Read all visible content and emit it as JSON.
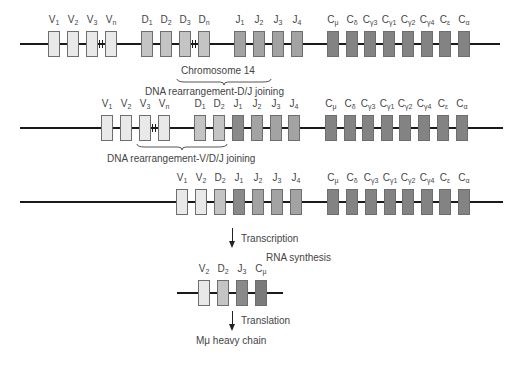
{
  "colors": {
    "V": "#e9e9e9",
    "D": "#c4c4c4",
    "J": "#a3a3a3",
    "J_dark": "#8a8a8a",
    "C": "#838383",
    "C_mu_rna": "#7a7a7a",
    "line": "#1a1a1a"
  },
  "rows": [
    {
      "name": "germline",
      "line": {
        "x1": 20,
        "x2": 500,
        "y": 44
      },
      "segments": [
        {
          "id": "V1",
          "base": "V",
          "sub": "1",
          "x": 48,
          "type": "V"
        },
        {
          "id": "V2",
          "base": "V",
          "sub": "2",
          "x": 67,
          "type": "V"
        },
        {
          "id": "V3",
          "base": "V",
          "sub": "3",
          "x": 86,
          "type": "V"
        },
        {
          "id": "Vn",
          "base": "V",
          "sub": "n",
          "x": 105,
          "type": "V"
        },
        {
          "id": "D1",
          "base": "D",
          "sub": "1",
          "x": 141,
          "type": "D"
        },
        {
          "id": "D2",
          "base": "D",
          "sub": "2",
          "x": 160,
          "type": "D"
        },
        {
          "id": "D3",
          "base": "D",
          "sub": "3",
          "x": 179,
          "type": "D"
        },
        {
          "id": "Dn",
          "base": "D",
          "sub": "n",
          "x": 198,
          "type": "D"
        },
        {
          "id": "J1",
          "base": "J",
          "sub": "1",
          "x": 234,
          "type": "J"
        },
        {
          "id": "J2",
          "base": "J",
          "sub": "2",
          "x": 253,
          "type": "J"
        },
        {
          "id": "J3",
          "base": "J",
          "sub": "3",
          "x": 272,
          "type": "J"
        },
        {
          "id": "J4",
          "base": "J",
          "sub": "4",
          "x": 291,
          "type": "J"
        },
        {
          "id": "Cmu",
          "base": "C",
          "sub": "μ",
          "x": 327,
          "type": "C"
        },
        {
          "id": "Cdelta",
          "base": "C",
          "sub": "δ",
          "x": 346,
          "type": "C"
        },
        {
          "id": "Cgamma3",
          "base": "C",
          "sub": "γ3",
          "x": 364,
          "type": "C"
        },
        {
          "id": "Cgamma1",
          "base": "C",
          "sub": "γ1",
          "x": 383,
          "type": "C"
        },
        {
          "id": "Cgamma2",
          "base": "C",
          "sub": "γ2",
          "x": 402,
          "type": "C"
        },
        {
          "id": "Cgamma4",
          "base": "C",
          "sub": "γ4",
          "x": 421,
          "type": "C"
        },
        {
          "id": "Cepsilon",
          "base": "C",
          "sub": "ε",
          "x": 439,
          "type": "C"
        },
        {
          "id": "Calpha",
          "base": "C",
          "sub": "α",
          "x": 458,
          "type": "C"
        }
      ],
      "breaks": [
        {
          "x": 99
        },
        {
          "x": 192
        }
      ]
    },
    {
      "name": "dj-joined",
      "line": {
        "x1": 20,
        "x2": 503,
        "y": 128
      },
      "segments": [
        {
          "id": "V1",
          "base": "V",
          "sub": "1",
          "x": 101,
          "type": "V"
        },
        {
          "id": "V2",
          "base": "V",
          "sub": "2",
          "x": 120,
          "type": "V"
        },
        {
          "id": "V3",
          "base": "V",
          "sub": "3",
          "x": 139,
          "type": "V"
        },
        {
          "id": "Vn",
          "base": "V",
          "sub": "n",
          "x": 158,
          "type": "V"
        },
        {
          "id": "D1",
          "base": "D",
          "sub": "1",
          "x": 194,
          "type": "D"
        },
        {
          "id": "D2",
          "base": "D",
          "sub": "2",
          "x": 213,
          "type": "D"
        },
        {
          "id": "J1",
          "base": "J",
          "sub": "1",
          "x": 232,
          "type": "J_dark"
        },
        {
          "id": "J2",
          "base": "J",
          "sub": "2",
          "x": 251,
          "type": "J"
        },
        {
          "id": "J3",
          "base": "J",
          "sub": "3",
          "x": 270,
          "type": "J"
        },
        {
          "id": "J4",
          "base": "J",
          "sub": "4",
          "x": 288,
          "type": "J"
        },
        {
          "id": "Cmu",
          "base": "C",
          "sub": "μ",
          "x": 325,
          "type": "C"
        },
        {
          "id": "Cdelta",
          "base": "C",
          "sub": "δ",
          "x": 344,
          "type": "C"
        },
        {
          "id": "Cgamma3",
          "base": "C",
          "sub": "γ3",
          "x": 362,
          "type": "C"
        },
        {
          "id": "Cgamma1",
          "base": "C",
          "sub": "γ1",
          "x": 381,
          "type": "C"
        },
        {
          "id": "Cgamma2",
          "base": "C",
          "sub": "γ2",
          "x": 399,
          "type": "C"
        },
        {
          "id": "Cgamma4",
          "base": "C",
          "sub": "γ4",
          "x": 418,
          "type": "C"
        },
        {
          "id": "Cepsilon",
          "base": "C",
          "sub": "ε",
          "x": 437,
          "type": "C"
        },
        {
          "id": "Calpha",
          "base": "C",
          "sub": "α",
          "x": 456,
          "type": "C"
        }
      ],
      "breaks": [
        {
          "x": 152
        }
      ]
    },
    {
      "name": "vdj-joined",
      "line": {
        "x1": 20,
        "x2": 503,
        "y": 202
      },
      "segments": [
        {
          "id": "V1",
          "base": "V",
          "sub": "1",
          "x": 176,
          "type": "V"
        },
        {
          "id": "V2",
          "base": "V",
          "sub": "2",
          "x": 195,
          "type": "V"
        },
        {
          "id": "D2",
          "base": "D",
          "sub": "2",
          "x": 214,
          "type": "D"
        },
        {
          "id": "J1",
          "base": "J",
          "sub": "1",
          "x": 233,
          "type": "J_dark"
        },
        {
          "id": "J2",
          "base": "J",
          "sub": "2",
          "x": 252,
          "type": "J"
        },
        {
          "id": "J3",
          "base": "J",
          "sub": "3",
          "x": 271,
          "type": "J"
        },
        {
          "id": "J4",
          "base": "J",
          "sub": "4",
          "x": 290,
          "type": "J"
        },
        {
          "id": "Cmu",
          "base": "C",
          "sub": "μ",
          "x": 327,
          "type": "C"
        },
        {
          "id": "Cdelta",
          "base": "C",
          "sub": "δ",
          "x": 346,
          "type": "C"
        },
        {
          "id": "Cgamma3",
          "base": "C",
          "sub": "γ3",
          "x": 365,
          "type": "C"
        },
        {
          "id": "Cgamma1",
          "base": "C",
          "sub": "γ1",
          "x": 384,
          "type": "C"
        },
        {
          "id": "Cgamma2",
          "base": "C",
          "sub": "γ2",
          "x": 402,
          "type": "C"
        },
        {
          "id": "Cgamma4",
          "base": "C",
          "sub": "γ4",
          "x": 421,
          "type": "C"
        },
        {
          "id": "Cepsilon",
          "base": "C",
          "sub": "ε",
          "x": 439,
          "type": "C"
        },
        {
          "id": "Calpha",
          "base": "C",
          "sub": "α",
          "x": 458,
          "type": "C"
        }
      ],
      "breaks": []
    },
    {
      "name": "rna",
      "line": {
        "x1": 177,
        "x2": 283,
        "y": 293
      },
      "segments": [
        {
          "id": "V2",
          "base": "V",
          "sub": "2",
          "x": 198,
          "type": "V"
        },
        {
          "id": "D2",
          "base": "D",
          "sub": "2",
          "x": 217,
          "type": "D"
        },
        {
          "id": "J3",
          "base": "J",
          "sub": "3",
          "x": 236,
          "type": "J_dark"
        },
        {
          "id": "Cmu",
          "base": "C",
          "sub": "μ",
          "x": 255,
          "type": "C_mu_rna"
        }
      ],
      "breaks": []
    }
  ],
  "annotations": {
    "chromosome": "Chromosome 14",
    "dj_joining": "DNA rearrangement-D/J joining",
    "vdj_joining": "DNA rearrangement-V/D/J joining",
    "transcription": "Transcription",
    "rna_synthesis": "RNA synthesis",
    "translation": "Translation",
    "product": "Mμ heavy chain"
  }
}
